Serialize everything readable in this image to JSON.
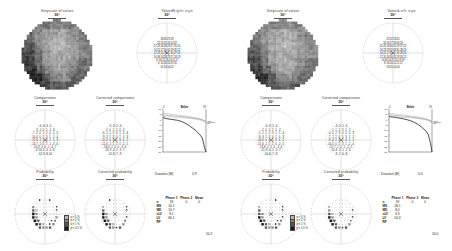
{
  "page": {
    "background": "#ffffff",
    "eyes": [
      {
        "id": "right",
        "label": "Right eye"
      },
      {
        "id": "left",
        "label": "Left eye"
      }
    ]
  },
  "plot_titles": {
    "greyscale": "Greyscale of values",
    "values": "Values",
    "comparison": "Comparisons",
    "corrected_comparison": "Corrected comparisons",
    "probability": "Probability",
    "corrected_probability": "Corrected probability",
    "cumulative_defect": "Cumulative defect curve",
    "degrees": "30°"
  },
  "curve_labels": {
    "top_left": "0",
    "top_center": "Bebie",
    "top_right": "59",
    "right_1": "5%",
    "right_2": "Normal",
    "right_3": "95%",
    "y_bottom": "-30 (dB)",
    "y_top": "dB"
  },
  "prob_legend": [
    {
      "label": "p < 5 %",
      "color": "#b9b9b9"
    },
    {
      "label": "p < 2 %",
      "color": "#8a8a8a"
    },
    {
      "label": "p < 1 %",
      "color": "#555555"
    },
    {
      "label": "p < 0.5 %",
      "color": "#1a1a1a"
    }
  ],
  "summary": {
    "duration_label": "Duration (M)",
    "right_duration": "5:9",
    "left_duration": "5:4"
  },
  "stats_table": {
    "columns": [
      "",
      "Phase 1",
      "Phase 2",
      "Mean"
    ],
    "right": {
      "rows": [
        {
          "label": "n",
          "phase1": "59",
          "phase2": "0",
          "mean": "0"
        },
        {
          "label": "MS",
          "phase1": "16.1",
          "phase2": "",
          "mean": ""
        },
        {
          "label": "MD",
          "phase1": "10.7",
          "phase2": "",
          "mean": ""
        },
        {
          "label": "sLV",
          "phase1": "8.1",
          "phase2": "",
          "mean": ""
        },
        {
          "label": "LV",
          "phase1": "66.1",
          "phase2": "",
          "mean": ""
        },
        {
          "label": "RF",
          "phase1": "",
          "phase2": "",
          "mean": ""
        }
      ],
      "footer": "10.2"
    },
    "left": {
      "rows": [
        {
          "label": "n",
          "phase1": "59",
          "phase2": "0",
          "mean": "0"
        },
        {
          "label": "MS",
          "phase1": "18.1",
          "phase2": "",
          "mean": ""
        },
        {
          "label": "MD",
          "phase1": "8.4",
          "phase2": "",
          "mean": ""
        },
        {
          "label": "sLV",
          "phase1": "6.9",
          "phase2": "",
          "mean": ""
        },
        {
          "label": "LV",
          "phase1": "54.3",
          "phase2": "",
          "mean": ""
        },
        {
          "label": "RF",
          "phase1": "",
          "phase2": "",
          "mean": ""
        }
      ],
      "footer": "10.0"
    }
  },
  "chart_data": [
    {
      "id": "bebie-right",
      "type": "line",
      "title": "Bebie",
      "xlabel": "",
      "ylabel": "dB",
      "xlim": [
        0,
        59
      ],
      "ylim": [
        -30,
        10
      ],
      "grid": false,
      "legend_position": "right",
      "x": [
        0,
        5,
        10,
        15,
        20,
        25,
        30,
        35,
        40,
        45,
        50,
        54,
        57,
        59
      ],
      "series": [
        {
          "name": "Patient",
          "values": [
            2,
            1,
            0.5,
            0,
            -0.5,
            -1.5,
            -3,
            -5,
            -7.5,
            -10,
            -13.5,
            -17,
            -26,
            -30
          ]
        },
        {
          "name": "95%",
          "values": [
            6,
            5.6,
            5.2,
            4.8,
            4.4,
            4,
            3.5,
            3,
            2.4,
            1.8,
            1,
            0.2,
            -0.6,
            -1.4
          ]
        },
        {
          "name": "Normal",
          "values": [
            4.5,
            4.2,
            3.9,
            3.6,
            3.3,
            3,
            2.6,
            2.2,
            1.7,
            1.2,
            0.5,
            -0.3,
            -1.2,
            -2
          ]
        },
        {
          "name": "5%",
          "values": [
            3,
            2.8,
            2.6,
            2.4,
            2.2,
            2,
            1.7,
            1.4,
            1,
            0.6,
            0,
            -0.8,
            -1.8,
            -2.8
          ]
        }
      ]
    },
    {
      "id": "bebie-left",
      "type": "line",
      "title": "Bebie",
      "xlabel": "",
      "ylabel": "dB",
      "xlim": [
        0,
        59
      ],
      "ylim": [
        -30,
        10
      ],
      "grid": false,
      "legend_position": "right",
      "x": [
        0,
        5,
        10,
        15,
        20,
        25,
        30,
        35,
        40,
        45,
        50,
        54,
        57,
        59
      ],
      "series": [
        {
          "name": "Patient",
          "values": [
            3,
            2.5,
            2,
            1.5,
            0.8,
            0,
            -1,
            -2.5,
            -4.5,
            -7,
            -10,
            -14,
            -22,
            -30
          ]
        },
        {
          "name": "95%",
          "values": [
            6,
            5.6,
            5.2,
            4.8,
            4.4,
            4,
            3.5,
            3,
            2.4,
            1.8,
            1,
            0.2,
            -0.6,
            -1.4
          ]
        },
        {
          "name": "Normal",
          "values": [
            4.5,
            4.2,
            3.9,
            3.6,
            3.3,
            3,
            2.6,
            2.2,
            1.7,
            1.2,
            0.5,
            -0.3,
            -1.2,
            -2
          ]
        },
        {
          "name": "5%",
          "values": [
            3,
            2.8,
            2.6,
            2.4,
            2.2,
            2,
            1.7,
            1.4,
            1,
            0.6,
            0,
            -0.8,
            -1.8,
            -2.8
          ]
        }
      ]
    }
  ],
  "field_data": {
    "right": {
      "values": [
        18,
        20,
        21,
        19,
        22,
        24,
        25,
        26,
        24,
        22,
        17,
        23,
        26,
        28,
        29,
        27,
        25,
        20,
        14,
        21,
        27,
        30,
        31,
        29,
        26,
        22,
        12,
        19,
        25,
        29,
        0,
        30,
        27,
        23,
        10,
        18,
        24,
        28,
        29,
        27,
        24,
        19,
        8,
        16,
        22,
        25,
        24,
        21,
        17,
        6,
        14,
        18,
        20,
        19,
        15,
        11,
        13,
        14,
        12
      ],
      "comparison": [
        -6,
        -4,
        -3,
        -5,
        -3,
        -1,
        0,
        1,
        -1,
        -3,
        -7,
        -2,
        0,
        1,
        2,
        0,
        -2,
        -5,
        -10,
        -4,
        0,
        2,
        3,
        1,
        -1,
        -4,
        -12,
        -6,
        -1,
        1,
        0,
        2,
        -1,
        -3,
        -13,
        -7,
        -2,
        0,
        1,
        -1,
        -3,
        -6,
        -15,
        -9,
        -3,
        0,
        -1,
        -4,
        -7,
        -17,
        -10,
        -5,
        -3,
        -4,
        -8,
        -12,
        -9,
        -8,
        -10
      ],
      "corrected": [
        -5,
        -3,
        -2,
        -4,
        -2,
        0,
        1,
        2,
        0,
        -2,
        -6,
        -1,
        1,
        2,
        3,
        1,
        -1,
        -4,
        -9,
        -3,
        1,
        3,
        4,
        2,
        0,
        -3,
        -11,
        -5,
        0,
        2,
        1,
        3,
        0,
        -2,
        -12,
        -6,
        -1,
        1,
        2,
        0,
        -2,
        -5,
        -14,
        -8,
        -2,
        1,
        0,
        -3,
        -6,
        -16,
        -9,
        -4,
        -2,
        -3,
        -7,
        -11,
        -8,
        -7,
        -9
      ],
      "probability": [
        1,
        0,
        0,
        1,
        0,
        0,
        0,
        0,
        0,
        0,
        2,
        0,
        0,
        0,
        0,
        0,
        0,
        1,
        3,
        1,
        0,
        0,
        0,
        0,
        0,
        1,
        4,
        2,
        0,
        0,
        0,
        0,
        0,
        0,
        4,
        2,
        0,
        0,
        0,
        0,
        0,
        2,
        4,
        3,
        0,
        0,
        0,
        1,
        2,
        4,
        3,
        1,
        0,
        1,
        2,
        3,
        2,
        2,
        3
      ],
      "corrected_probability": [
        1,
        0,
        0,
        0,
        0,
        0,
        0,
        0,
        0,
        0,
        1,
        0,
        0,
        0,
        0,
        0,
        0,
        1,
        3,
        0,
        0,
        0,
        0,
        0,
        0,
        1,
        4,
        2,
        0,
        0,
        0,
        0,
        0,
        0,
        4,
        2,
        0,
        0,
        0,
        0,
        0,
        1,
        4,
        3,
        0,
        0,
        0,
        0,
        2,
        4,
        3,
        1,
        0,
        0,
        2,
        3,
        2,
        1,
        3
      ]
    },
    "left": {
      "values": [
        21,
        22,
        23,
        21,
        24,
        26,
        27,
        28,
        26,
        24,
        20,
        25,
        28,
        30,
        31,
        29,
        27,
        22,
        16,
        23,
        29,
        32,
        33,
        31,
        28,
        24,
        14,
        21,
        27,
        31,
        0,
        32,
        29,
        25,
        12,
        20,
        26,
        30,
        31,
        29,
        26,
        21,
        10,
        18,
        24,
        27,
        26,
        23,
        19,
        8,
        16,
        20,
        22,
        21,
        17,
        13,
        15,
        16,
        14
      ],
      "comparison": [
        -4,
        -3,
        -2,
        -4,
        -2,
        0,
        1,
        2,
        0,
        -2,
        -5,
        -1,
        1,
        2,
        3,
        1,
        -1,
        -4,
        -8,
        -3,
        1,
        3,
        4,
        2,
        0,
        -3,
        -10,
        -5,
        0,
        2,
        1,
        3,
        0,
        -2,
        -11,
        -6,
        -1,
        1,
        2,
        0,
        -2,
        -5,
        -13,
        -8,
        -2,
        1,
        0,
        -3,
        -6,
        -15,
        -9,
        -4,
        -2,
        -3,
        -7,
        -10,
        -8,
        -7,
        -9
      ],
      "corrected": [
        -3,
        -2,
        -1,
        -3,
        -1,
        1,
        2,
        3,
        1,
        -1,
        -4,
        0,
        2,
        3,
        4,
        2,
        0,
        -3,
        -7,
        -2,
        2,
        4,
        5,
        3,
        1,
        -2,
        -9,
        -4,
        1,
        3,
        2,
        4,
        1,
        -1,
        -10,
        -5,
        0,
        2,
        3,
        1,
        -1,
        -4,
        -12,
        -7,
        -1,
        2,
        1,
        -2,
        -5,
        -14,
        -8,
        -3,
        -1,
        -2,
        -6,
        -9,
        -7,
        -6,
        -8
      ],
      "probability": [
        0,
        0,
        0,
        1,
        0,
        0,
        0,
        0,
        0,
        0,
        1,
        0,
        0,
        0,
        0,
        0,
        0,
        1,
        3,
        0,
        0,
        0,
        0,
        0,
        0,
        1,
        3,
        2,
        0,
        0,
        0,
        0,
        0,
        0,
        4,
        2,
        0,
        0,
        0,
        0,
        0,
        1,
        4,
        3,
        0,
        0,
        0,
        1,
        2,
        4,
        3,
        1,
        0,
        1,
        2,
        3,
        2,
        2,
        3
      ],
      "corrected_probability": [
        0,
        0,
        0,
        0,
        0,
        0,
        0,
        0,
        0,
        0,
        1,
        0,
        0,
        0,
        0,
        0,
        0,
        0,
        2,
        0,
        0,
        0,
        0,
        0,
        0,
        1,
        3,
        1,
        0,
        0,
        0,
        0,
        0,
        0,
        4,
        2,
        0,
        0,
        0,
        0,
        0,
        1,
        4,
        3,
        0,
        0,
        0,
        0,
        1,
        4,
        3,
        0,
        0,
        0,
        2,
        3,
        2,
        1,
        3
      ]
    }
  }
}
